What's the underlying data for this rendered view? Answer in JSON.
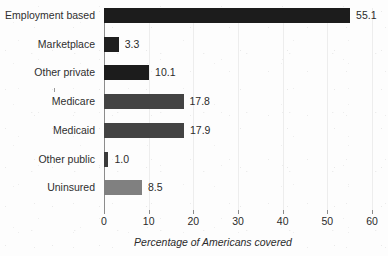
{
  "chart_data": {
    "type": "bar",
    "orientation": "horizontal",
    "title": "",
    "xlabel": "Percentage of Americans covered",
    "ylabel": "",
    "xlim": [
      0,
      60
    ],
    "xticks": [
      0,
      10,
      20,
      30,
      40,
      50,
      60
    ],
    "grid": true,
    "grid_axis": "x",
    "legend": false,
    "categories": [
      "Employment based",
      "Marketplace",
      "Other private",
      "Medicare",
      "Medicaid",
      "Other public",
      "Uninsured"
    ],
    "values": [
      55.1,
      3.3,
      10.1,
      17.8,
      17.9,
      1.0,
      8.5
    ],
    "value_labels": [
      "55.1",
      "3.3",
      "10.1",
      "17.8",
      "17.9",
      "1.0",
      "8.5"
    ],
    "bar_colors": [
      "#1c1c1c",
      "#1f1f1f",
      "#1c1c1c",
      "#434343",
      "#434343",
      "#3b3b3b",
      "#808080"
    ]
  },
  "axis": {
    "tick_labels": [
      "0",
      "10",
      "20",
      "30",
      "40",
      "50",
      "60"
    ],
    "x_title": "Percentage of Americans covered"
  }
}
